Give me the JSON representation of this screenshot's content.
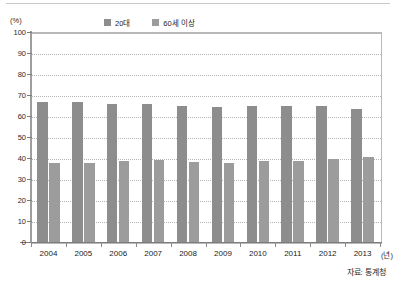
{
  "unit_label": "(%)",
  "source_note": "자료: 통계청",
  "x_axis_unit": "(년)",
  "legend": [
    {
      "label": "20대",
      "color": "#8d8d8d",
      "swatch_name": "legend-swatch-20s"
    },
    {
      "label": "60세 이상",
      "color": "#9c9c9c",
      "swatch_name": "legend-swatch-60plus"
    }
  ],
  "chart_data": {
    "type": "bar",
    "title": "",
    "xlabel": "(년)",
    "ylabel": "(%)",
    "ylim": [
      0,
      100
    ],
    "yticks": [
      0,
      10,
      20,
      30,
      40,
      50,
      60,
      70,
      80,
      90,
      100
    ],
    "ytick_labels": [
      "0",
      "10",
      "20",
      "30",
      "40",
      "50",
      "60",
      "70",
      "80",
      "90",
      "100"
    ],
    "grid": true,
    "legend_position": "top-center",
    "categories": [
      "2004",
      "2005",
      "2006",
      "2007",
      "2008",
      "2009",
      "2010",
      "2011",
      "2012",
      "2013"
    ],
    "series": [
      {
        "name": "20대",
        "color": "#8d8d8d",
        "values": [
          66.5,
          66.6,
          65.8,
          65.7,
          64.7,
          64.3,
          64.7,
          64.9,
          64.6,
          63.2
        ]
      },
      {
        "name": "60세 이상",
        "color": "#9c9c9c",
        "values": [
          37.5,
          37.5,
          38.6,
          38.9,
          38.1,
          37.6,
          38.6,
          38.8,
          39.6,
          40.5
        ]
      }
    ]
  }
}
